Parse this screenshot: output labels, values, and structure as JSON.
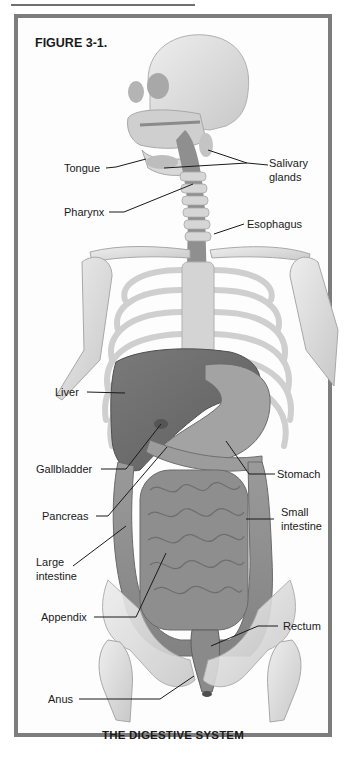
{
  "figure": {
    "number_label": "FIGURE 3-1.",
    "caption": "THE DIGESTIVE SYSTEM"
  },
  "labels": {
    "tongue": "Tongue",
    "salivary_glands_line1": "Salivary",
    "salivary_glands_line2": "glands",
    "pharynx": "Pharynx",
    "esophagus": "Esophagus",
    "liver": "Liver",
    "gallbladder": "Gallbladder",
    "stomach": "Stomach",
    "pancreas": "Pancreas",
    "small_intestine_line1": "Small",
    "small_intestine_line2": "intestine",
    "large_intestine_line1": "Large",
    "large_intestine_line2": "intestine",
    "appendix": "Appendix",
    "rectum": "Rectum",
    "anus": "Anus"
  },
  "colors": {
    "frame": "#7d7d7d",
    "bone": "#dcdcdc",
    "organ_dark": "#6e6e6e",
    "organ_mid": "#8d8d8d",
    "text": "#1a1a1a"
  }
}
